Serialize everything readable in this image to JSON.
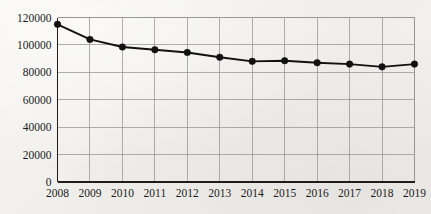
{
  "chart_data": {
    "type": "line",
    "title": "",
    "subtitle": "",
    "xlabel": "",
    "ylabel": "",
    "categories": [
      "2008",
      "2009",
      "2010",
      "2011",
      "2012",
      "2013",
      "2014",
      "2015",
      "2016",
      "2017",
      "2018",
      "2019"
    ],
    "values": [
      115000,
      104000,
      98500,
      96500,
      94500,
      91000,
      88000,
      88500,
      87000,
      86000,
      84000,
      86000
    ],
    "series": [
      {
        "name": "series-1",
        "values": [
          115000,
          104000,
          98500,
          96500,
          94500,
          91000,
          88000,
          88500,
          87000,
          86000,
          84000,
          86000
        ],
        "color": "#111111",
        "marker": "circle"
      }
    ],
    "ylim": [
      0,
      120000
    ],
    "yticks": [
      0,
      20000,
      40000,
      60000,
      80000,
      100000,
      120000
    ],
    "ytick_labels": [
      "0",
      "20000",
      "40000",
      "60000",
      "80000",
      "100000",
      "120000"
    ],
    "xtick_labels": [
      "2008",
      "2009",
      "2010",
      "2011",
      "2012",
      "2013",
      "2014",
      "2015",
      "2016",
      "2017",
      "2018",
      "2019"
    ],
    "grid": {
      "horizontal": true,
      "vertical": true,
      "color": "#8e8e8e"
    },
    "legend": {
      "visible": false,
      "position": "none",
      "entries": []
    },
    "annotations": [],
    "background_color": "#f4f3f1",
    "axis_color": "#1d1d1d"
  }
}
